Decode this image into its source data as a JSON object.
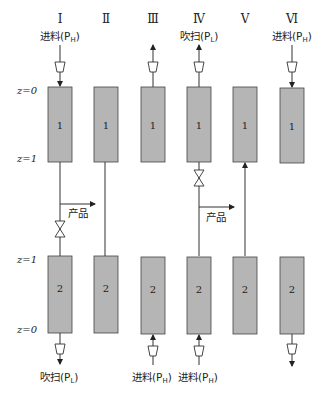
{
  "diagram": {
    "type": "pressure swing adsorption step sequence",
    "steps": [
      {
        "roman": "Ⅰ",
        "top_label": "进料(P",
        "top_sub": "H",
        "bottom_label": "吹扫(P",
        "bottom_sub": "L",
        "product_label": "产品"
      },
      {
        "roman": "Ⅱ"
      },
      {
        "roman": "Ⅲ"
      },
      {
        "roman": "Ⅳ",
        "top_label": "吹扫(P",
        "top_sub": "L",
        "product_label": "产品"
      },
      {
        "roman": "Ⅴ"
      },
      {
        "roman": "Ⅵ",
        "top_label": "进料(P",
        "top_sub": "H"
      }
    ],
    "bottom_labels": [
      {
        "col": 3,
        "text": "进料(P",
        "sub": "H"
      },
      {
        "col": 4,
        "text": "进料(P",
        "sub": "H"
      }
    ],
    "bed_labels": {
      "top": "1",
      "bottom": "2"
    },
    "z_labels": {
      "top_z0": "z=0",
      "top_z1": "z=1",
      "bottom_z1": "z=1",
      "bottom_z0": "z=0"
    },
    "colors": {
      "bed_fill": "#b5b5b5",
      "line": "#333333"
    }
  }
}
